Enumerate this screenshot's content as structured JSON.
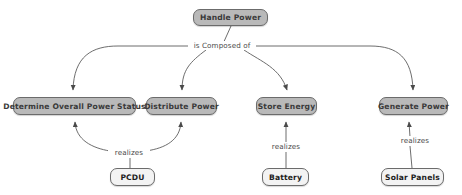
{
  "diagram": {
    "colors": {
      "process_fill": "#b9b9b9",
      "component_fill": "#f3f3f3",
      "node_border": "#6b6b6b",
      "edge_stroke": "#585858",
      "background": "#ffffff",
      "label_text": "#4a4a4a"
    },
    "nodes": [
      {
        "id": "handle-power",
        "label": "Handle Power",
        "type": "process",
        "x": 193,
        "y": 9,
        "w": 75,
        "h": 17
      },
      {
        "id": "determine-status",
        "label": "Determine Overall Power Status",
        "type": "process",
        "x": 13,
        "y": 97,
        "w": 123,
        "h": 18
      },
      {
        "id": "distribute-power",
        "label": "Distribute Power",
        "type": "process",
        "x": 146,
        "y": 97,
        "w": 71,
        "h": 18
      },
      {
        "id": "store-energy",
        "label": "Store Energy",
        "type": "process",
        "x": 256,
        "y": 97,
        "w": 61,
        "h": 18
      },
      {
        "id": "generate-power",
        "label": "Generate Power",
        "type": "process",
        "x": 379,
        "y": 97,
        "w": 69,
        "h": 18
      },
      {
        "id": "pcdu",
        "label": "PCDU",
        "type": "component",
        "x": 110,
        "y": 168,
        "w": 45,
        "h": 18
      },
      {
        "id": "battery",
        "label": "Battery",
        "type": "component",
        "x": 262,
        "y": 168,
        "w": 47,
        "h": 18
      },
      {
        "id": "solar-panels",
        "label": "Solar Panels",
        "type": "component",
        "x": 381,
        "y": 168,
        "w": 63,
        "h": 18
      }
    ],
    "edge_labels": [
      {
        "id": "is-composed-of",
        "text": "is Composed of",
        "x": 188,
        "y": 42,
        "w": 64
      },
      {
        "id": "realizes-pcdu",
        "text": "realizes",
        "x": 108,
        "y": 149,
        "w": 38
      },
      {
        "id": "realizes-battery",
        "text": "realizes",
        "x": 265,
        "y": 143,
        "w": 38
      },
      {
        "id": "realizes-solar",
        "text": "realizes",
        "x": 394,
        "y": 137,
        "w": 38
      }
    ],
    "edges": [
      {
        "id": "edge-handle-to-determine",
        "from": "handle-power",
        "to": "determine-status",
        "relation": "is Composed of"
      },
      {
        "id": "edge-handle-to-distribute",
        "from": "handle-power",
        "to": "distribute-power",
        "relation": "is Composed of"
      },
      {
        "id": "edge-handle-to-store",
        "from": "handle-power",
        "to": "store-energy",
        "relation": "is Composed of"
      },
      {
        "id": "edge-handle-to-generate",
        "from": "handle-power",
        "to": "generate-power",
        "relation": "is Composed of"
      },
      {
        "id": "edge-pcdu-to-determine",
        "from": "pcdu",
        "to": "determine-status",
        "relation": "realizes"
      },
      {
        "id": "edge-pcdu-to-distribute",
        "from": "pcdu",
        "to": "distribute-power",
        "relation": "realizes"
      },
      {
        "id": "edge-battery-to-store",
        "from": "battery",
        "to": "store-energy",
        "relation": "realizes"
      },
      {
        "id": "edge-solar-to-generate",
        "from": "solar-panels",
        "to": "generate-power",
        "relation": "realizes"
      }
    ]
  }
}
